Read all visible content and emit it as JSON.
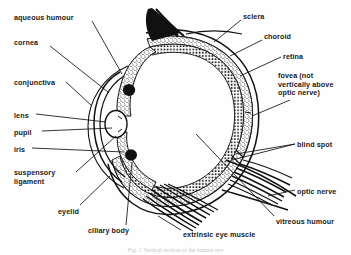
{
  "diagram": {
    "title": "Vertical section of the human eye",
    "background_color": "#fefefe",
    "ink_color": "#111111",
    "caption": "Fig. 1 Vertical section of the human eye",
    "labels_left": [
      {
        "id": "aqueous-humour",
        "text": "aqueous humour",
        "x": 14,
        "y": 14
      },
      {
        "id": "cornea",
        "text": "cornea",
        "x": 14,
        "y": 39
      },
      {
        "id": "conjunctiva",
        "text": "conjunctiva",
        "x": 14,
        "y": 79
      },
      {
        "id": "lens",
        "text": "lens",
        "x": 14,
        "y": 112
      },
      {
        "id": "pupil",
        "text": "pupil",
        "x": 14,
        "y": 129
      },
      {
        "id": "iris",
        "text": "iris",
        "x": 14,
        "y": 146
      },
      {
        "id": "suspensory-ligament",
        "text": "suspensory\nligament",
        "x": 14,
        "y": 169
      },
      {
        "id": "eyelid",
        "text": "eyelid",
        "x": 58,
        "y": 208
      },
      {
        "id": "ciliary-body",
        "text": "ciliary body",
        "x": 88,
        "y": 227
      }
    ],
    "labels_right": [
      {
        "id": "sclera",
        "text": "sclera",
        "x": 243,
        "y": 13
      },
      {
        "id": "choroid",
        "text": "choroid",
        "x": 264,
        "y": 33
      },
      {
        "id": "retina",
        "text": "retina",
        "x": 283,
        "y": 53
      },
      {
        "id": "fovea",
        "text": "fovea (not\nvertically above\noptic nerve)",
        "x": 278,
        "y": 72
      },
      {
        "id": "blind-spot",
        "text": "blind spot",
        "x": 297,
        "y": 141
      },
      {
        "id": "optic-nerve",
        "text": "optic nerve",
        "x": 297,
        "y": 188
      },
      {
        "id": "vitreous-humour",
        "text": "vitreous humour",
        "x": 276,
        "y": 218
      },
      {
        "id": "extrinsic-eye-muscle",
        "text": "extrinsic eye muscle",
        "x": 183,
        "y": 231
      }
    ]
  }
}
